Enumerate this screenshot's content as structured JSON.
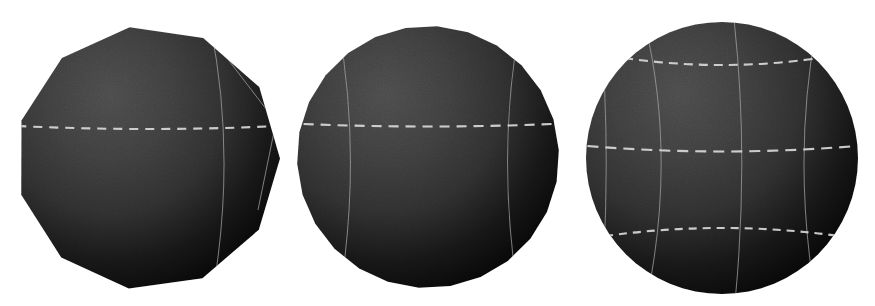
{
  "figure": {
    "background_color": "#ffffff",
    "width": 875,
    "height": 306,
    "panel_count": 3,
    "surface_color_light": "#4a4a4a",
    "surface_color_mid": "#2e2e2e",
    "surface_color_dark": "#050505",
    "wire_color": "#9a9a9a",
    "latitude_dash_color": "#d8d8d8"
  },
  "panels": [
    {
      "id": "panel-coarse",
      "name": "coarse-tessellation-sphere",
      "tessellation_level": "coarse",
      "shape": "polyhedral",
      "facet_count": 11,
      "bbox": {
        "x": 12,
        "y": 26,
        "width": 272,
        "height": 266
      },
      "center": {
        "cx": 148,
        "cy": 158
      },
      "radius": 132,
      "silhouette_sides": 11,
      "silhouette_rotation_deg": -8,
      "latitude_lines": [
        {
          "name": "equator",
          "y_offset": -32,
          "style": "dashed",
          "dash": "9 7",
          "width_scale": 0.99,
          "curve": 6
        }
      ],
      "meridian_lines": [
        {
          "name": "meridian-right",
          "x_offset": 62,
          "style": "solid",
          "bow": 18
        }
      ],
      "facet_edges": [
        {
          "name": "facet-seam-upper-right",
          "d": "M 210 36 L 276 122"
        },
        {
          "name": "facet-seam-mid-right",
          "d": "M 276 122 L 258 210"
        }
      ]
    },
    {
      "id": "panel-medium",
      "name": "medium-tessellation-sphere",
      "tessellation_level": "medium",
      "shape": "near-spherical",
      "facet_count": 48,
      "bbox": {
        "x": 297,
        "y": 24,
        "width": 262,
        "height": 266
      },
      "center": {
        "cx": 428,
        "cy": 157
      },
      "radius": 131,
      "silhouette_sides": 26,
      "silhouette_rotation_deg": 4,
      "latitude_lines": [
        {
          "name": "equator",
          "y_offset": -33,
          "style": "dashed",
          "dash": "10 7",
          "width_scale": 0.95,
          "curve": 5
        }
      ],
      "meridian_lines": [
        {
          "name": "meridian-left",
          "x_offset": -90,
          "style": "solid",
          "bow": 16
        },
        {
          "name": "meridian-right",
          "x_offset": 92,
          "style": "solid",
          "bow": -16
        }
      ],
      "facet_edges": []
    },
    {
      "id": "panel-fine",
      "name": "fine-tessellation-sphere",
      "tessellation_level": "fine",
      "shape": "smooth-sphere",
      "facet_count": 192,
      "bbox": {
        "x": 588,
        "y": 22,
        "width": 272,
        "height": 272
      },
      "center": {
        "cx": 722,
        "cy": 158
      },
      "radius": 136,
      "silhouette_sides": 64,
      "silhouette_rotation_deg": 0,
      "latitude_lines": [
        {
          "name": "latitude-upper",
          "y_offset": -100,
          "style": "dashed",
          "dash": "9 6",
          "width_scale": 0.72,
          "curve": 14
        },
        {
          "name": "equator",
          "y_offset": -12,
          "style": "dashed",
          "dash": "11 7",
          "width_scale": 0.99,
          "curve": 11
        },
        {
          "name": "latitude-lower",
          "y_offset": 78,
          "style": "dashed",
          "dash": "8 6",
          "width_scale": 0.86,
          "curve": -16
        }
      ],
      "meridian_lines": [
        {
          "name": "meridian-far-left",
          "x_offset": -122,
          "style": "solid",
          "bow": 8
        },
        {
          "name": "meridian-left",
          "x_offset": -78,
          "style": "solid",
          "bow": 22
        },
        {
          "name": "meridian-center",
          "x_offset": 12,
          "style": "solid",
          "bow": 10
        },
        {
          "name": "meridian-right",
          "x_offset": 96,
          "style": "solid",
          "bow": -18
        }
      ],
      "facet_edges": []
    }
  ],
  "lighting": {
    "name": "upper-left-key-light",
    "highlight_x_pct": 34,
    "highlight_y_pct": 26,
    "falloff": "radial",
    "ambient": 0.06
  }
}
